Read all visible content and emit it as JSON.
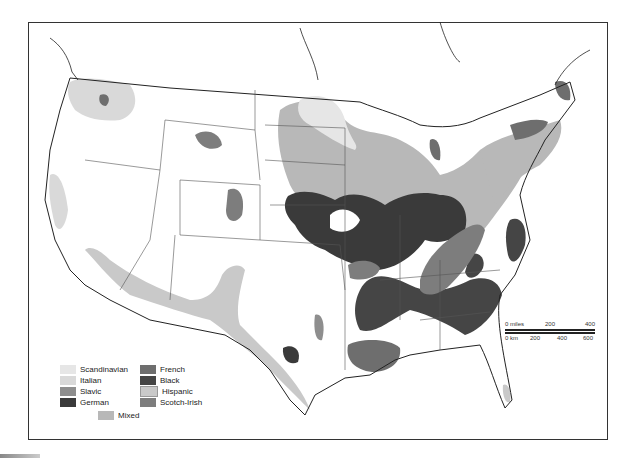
{
  "map": {
    "type": "thematic",
    "subject": "Ethnic regions of the United States",
    "colors": {
      "Scandinavian": "#e6e6e6",
      "Italian": "#d9d9d9",
      "Slavic": "#8e8e8e",
      "German": "#3a3a3a",
      "French": "#6e6e6e",
      "Black": "#454545",
      "Hispanic": "#c9c9c9",
      "Scotch-Irish": "#7d7d7d",
      "Mixed": "#b8b8b8"
    }
  },
  "legend": {
    "items": [
      {
        "label": "Scandinavian",
        "color": "#e6e6e6"
      },
      {
        "label": "Italian",
        "color": "#d9d9d9"
      },
      {
        "label": "Slavic",
        "color": "#8e8e8e"
      },
      {
        "label": "German",
        "color": "#3a3a3a"
      },
      {
        "label": "French",
        "color": "#6e6e6e"
      },
      {
        "label": "Black",
        "color": "#454545"
      },
      {
        "label": "Hispanic",
        "color": "#c9c9c9"
      },
      {
        "label": "Scotch-Irish",
        "color": "#7d7d7d"
      },
      {
        "label": "Mixed",
        "color": "#b8b8b8"
      }
    ]
  },
  "scale_bar": {
    "miles_label": "0 miles",
    "miles_ticks": [
      "200",
      "400"
    ],
    "km_label": "0 km",
    "km_ticks": [
      "200",
      "400",
      "600"
    ]
  }
}
